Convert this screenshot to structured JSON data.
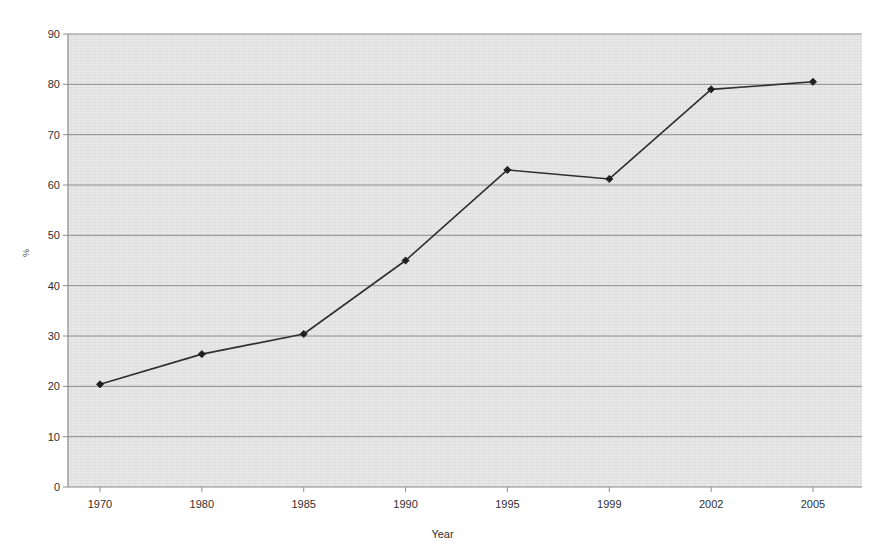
{
  "chart_data": {
    "type": "line",
    "title": "",
    "subtitle": "",
    "xlabel": "Year",
    "ylabel": "%",
    "categories": [
      "1970",
      "1980",
      "1985",
      "1990",
      "1995",
      "1999",
      "2002",
      "2005"
    ],
    "values": [
      20.4,
      26.4,
      30.4,
      45.0,
      63.0,
      61.2,
      79.0,
      80.5
    ],
    "series": [
      {
        "name": "",
        "values": [
          20.4,
          26.4,
          30.4,
          45.0,
          63.0,
          61.2,
          79.0,
          80.5
        ]
      }
    ],
    "ylim": [
      0,
      90
    ],
    "yticks": [
      0,
      10,
      20,
      30,
      40,
      50,
      60,
      70,
      80,
      90
    ],
    "ytick_labels": [
      "0",
      "10",
      "20",
      "30",
      "40",
      "50",
      "60",
      "70",
      "80",
      "90"
    ],
    "xtick_labels": [
      "1970",
      "1980",
      "1985",
      "1990",
      "1995",
      "1999",
      "2002",
      "2005"
    ],
    "grid": "horizontal",
    "legend": "none",
    "annotations": [],
    "marker": "diamond",
    "colors": {
      "line": "#2b2b2b",
      "marker": "#1a1a1a",
      "plot_background": "#e9e9e9",
      "gridline": "#8c8c8c",
      "axis": "#8c8c8c",
      "page_background": "#ffffff",
      "tick_text": "#2f2f2f"
    }
  }
}
